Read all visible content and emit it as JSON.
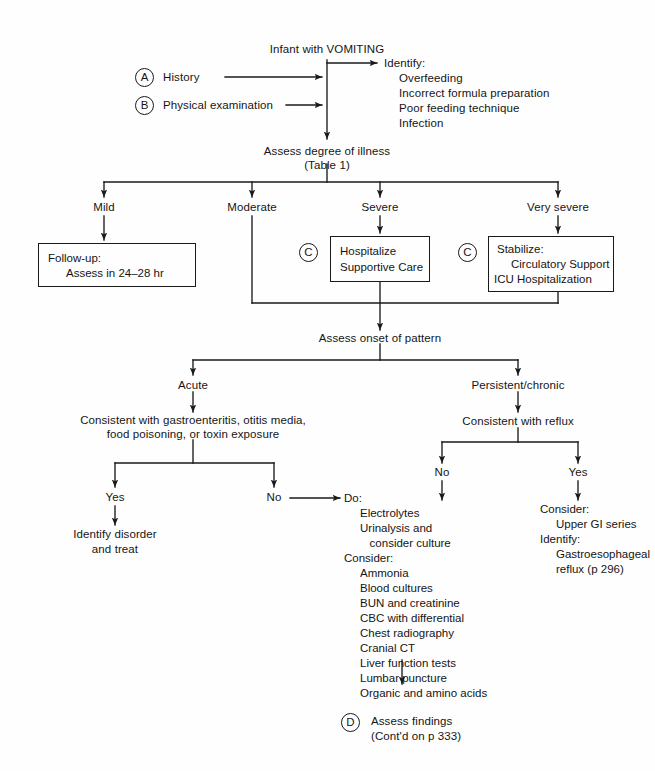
{
  "diagram": {
    "title": "Infant with VOMITING",
    "page_size": {
      "width": 655,
      "height": 771
    }
  },
  "top": {
    "root_label": "Infant with VOMITING",
    "step_a_marker": "A",
    "step_a_label": "History",
    "step_b_marker": "B",
    "step_b_label": "Physical examination",
    "identify_heading": "Identify:",
    "identify_items": [
      "Overfeeding",
      "Incorrect formula preparation",
      "Poor feeding technique",
      "Infection"
    ]
  },
  "severity": {
    "assess_line1": "Assess degree of illness",
    "assess_line2": "(Table 1)",
    "branches": [
      {
        "label": "Mild"
      },
      {
        "label": "Moderate"
      },
      {
        "label": "Severe"
      },
      {
        "label": "Very severe"
      }
    ],
    "mild_box": {
      "line1": "Follow-up:",
      "line2": "Assess in 24–28 hr"
    },
    "severe_marker": "C",
    "severe_box": {
      "line1": "Hospitalize",
      "line2": "Supportive Care"
    },
    "very_severe_marker": "C",
    "very_severe_box": {
      "line1": "Stabilize:",
      "line2": "Circulatory Support",
      "line3": "ICU Hospitalization"
    }
  },
  "onset": {
    "heading": "Assess onset of pattern",
    "acute_label": "Acute",
    "persistent_label": "Persistent/chronic",
    "acute_criteria_line1": "Consistent with gastroenteritis, otitis media,",
    "acute_criteria_line2": "food poisoning, or toxin exposure",
    "acute_yes": "Yes",
    "acute_no": "No",
    "identify_disorder_line1": "Identify disorder",
    "identify_disorder_line2": "and treat",
    "reflux_heading": "Consistent with reflux",
    "reflux_no": "No",
    "reflux_yes": "Yes"
  },
  "workup": {
    "do_heading": "Do:",
    "do_items": [
      "Electrolytes",
      "Urinalysis and",
      "   consider culture"
    ],
    "consider_heading": "Consider:",
    "consider_items": [
      "Ammonia",
      "Blood cultures",
      "BUN and creatinine",
      "CBC with differential",
      "Chest radiography",
      "Cranial CT",
      "Liver function tests",
      "Lumbar puncture",
      "Organic and amino acids"
    ],
    "step_d_marker": "D",
    "step_d_line1": "Assess findings",
    "step_d_line2": "(Cont'd on p 333)"
  },
  "reflux_yes_branch": {
    "consider_heading": "Consider:",
    "consider_item": "Upper GI series",
    "identify_heading": "Identify:",
    "identify_line1": "Gastroesophageal",
    "identify_line2": "reflux (p 296)"
  },
  "style": {
    "ink": "#1a1a1a",
    "paper": "#fffefe"
  }
}
